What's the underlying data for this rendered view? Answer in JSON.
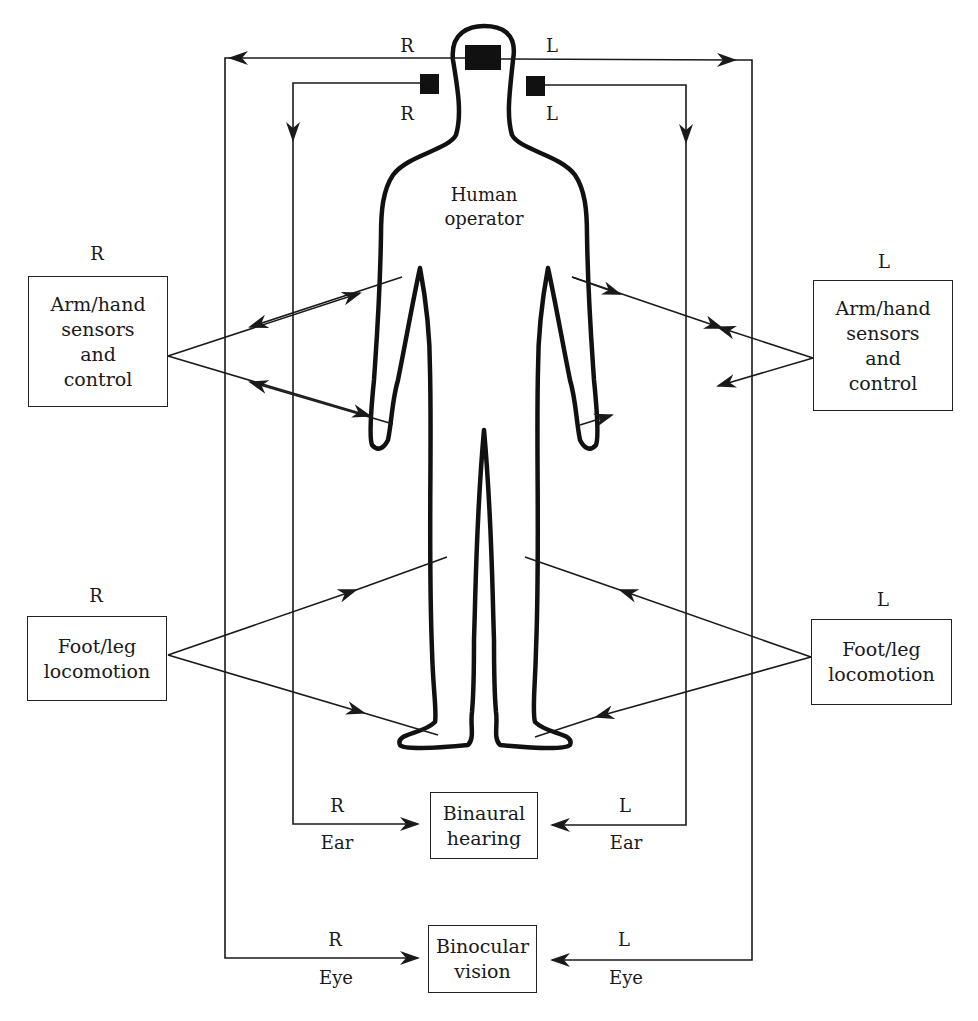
{
  "diagram": {
    "type": "human-operator sensory/control diagram",
    "center": {
      "label_line1": "Human",
      "label_line2": "operator"
    },
    "top_labels": {
      "eye_right": "R",
      "eye_left": "L",
      "ear_right": "R",
      "ear_left": "L"
    },
    "boxes": {
      "arm_right": {
        "side_label": "R",
        "lines": [
          "Arm/hand",
          "sensors",
          "and",
          "control"
        ]
      },
      "arm_left": {
        "side_label": "L",
        "lines": [
          "Arm/hand",
          "sensors",
          "and",
          "control"
        ]
      },
      "foot_right": {
        "side_label": "R",
        "lines": [
          "Foot/leg",
          "locomotion"
        ]
      },
      "foot_left": {
        "side_label": "L",
        "lines": [
          "Foot/leg",
          "locomotion"
        ]
      },
      "hearing": {
        "lines": [
          "Binaural",
          "hearing"
        ]
      },
      "vision": {
        "lines": [
          "Binocular",
          "vision"
        ]
      }
    },
    "bottom_labels": {
      "hearing_right_side": "R",
      "hearing_right_sub": "Ear",
      "hearing_left_side": "L",
      "hearing_left_sub": "Ear",
      "vision_right_side": "R",
      "vision_right_sub": "Eye",
      "vision_left_side": "L",
      "vision_left_sub": "Eye"
    },
    "colors": {
      "line": "#1a1a1a",
      "background": "#ffffff"
    }
  }
}
